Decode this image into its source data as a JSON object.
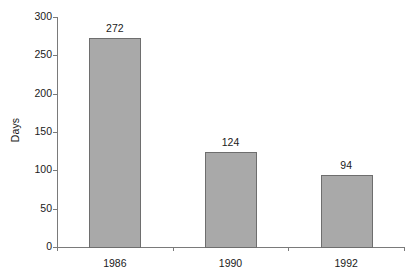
{
  "chart_data": {
    "type": "bar",
    "title": "",
    "subtitle": "",
    "xlabel": "",
    "ylabel": "Days",
    "categories": [
      "1986",
      "1990",
      "1992"
    ],
    "values": [
      272,
      124,
      94
    ],
    "data_labels": [
      "272",
      "124",
      "94"
    ],
    "ylim": [
      0,
      300
    ],
    "ytick_values": [
      0,
      50,
      100,
      150,
      200,
      250,
      300
    ],
    "ytick_labels": [
      "0",
      "50",
      "100",
      "150",
      "200",
      "250",
      "300"
    ],
    "grid": false,
    "legend": null,
    "legend_position": "none",
    "series": [
      {
        "name": "Days",
        "values": [
          272,
          124,
          94
        ]
      }
    ],
    "annotations": []
  },
  "style": {
    "bar_fill": "#a9a9a9",
    "bar_stroke": "#6e6e6e",
    "axis_color": "#7a7a7a",
    "text_color": "#1a1a1a",
    "background": "#ffffff"
  },
  "axes": {
    "y_axis_name": "y-axis",
    "x_axis_name": "x-axis"
  }
}
